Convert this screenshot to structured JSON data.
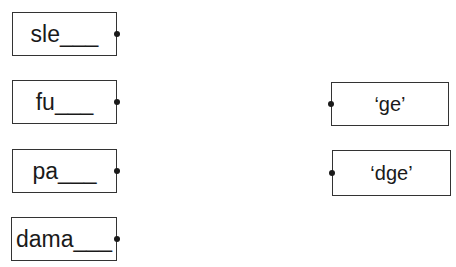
{
  "word_stems": [
    {
      "label": "sle___"
    },
    {
      "label": "fu___"
    },
    {
      "label": "pa___"
    },
    {
      "label": "dama___"
    }
  ],
  "endings": [
    {
      "label": "‘ge’"
    },
    {
      "label": "‘dge’"
    }
  ]
}
